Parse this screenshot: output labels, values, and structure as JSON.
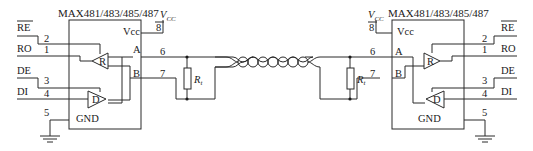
{
  "diagram": {
    "type": "RS-485 two-node connection schematic",
    "left_chip": {
      "title": "MAX481/483/485/487",
      "vcc_label": "Vcc",
      "a_label": "A",
      "b_label": "B",
      "gnd_label": "GND",
      "receiver_label": "R",
      "driver_label": "D",
      "supply": {
        "main": "V",
        "sub": "CC"
      },
      "signals": [
        {
          "name": "RE",
          "overbar": true,
          "pin": "2"
        },
        {
          "name": "RO",
          "overbar": false,
          "pin": "1"
        },
        {
          "name": "DE",
          "overbar": false,
          "pin": "3"
        },
        {
          "name": "DI",
          "overbar": false,
          "pin": "4"
        }
      ],
      "pins": {
        "vcc": "8",
        "a": "6",
        "b": "7",
        "gnd": "5"
      }
    },
    "right_chip": {
      "title": "MAX481/483/485/487",
      "vcc_label": "Vcc",
      "a_label": "A",
      "b_label": "B",
      "gnd_label": "GND",
      "receiver_label": "R",
      "driver_label": "D",
      "supply": {
        "main": "V",
        "sub": "CC"
      },
      "signals": [
        {
          "name": "RE",
          "overbar": true,
          "pin": "2"
        },
        {
          "name": "RO",
          "overbar": false,
          "pin": "1"
        },
        {
          "name": "DE",
          "overbar": false,
          "pin": "3"
        },
        {
          "name": "DI",
          "overbar": false,
          "pin": "4"
        }
      ],
      "pins": {
        "vcc": "8",
        "a": "6",
        "b": "7",
        "gnd": "5"
      }
    },
    "termination_left": {
      "main": "R",
      "sub": "t"
    },
    "termination_right": {
      "main": "R",
      "sub": "t"
    },
    "cable": "twisted-pair"
  }
}
